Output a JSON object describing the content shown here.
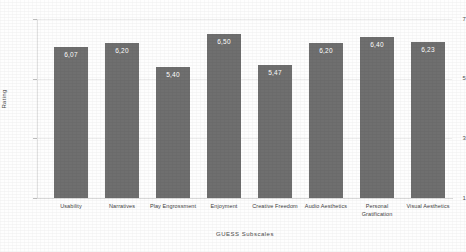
{
  "chart_data": {
    "type": "bar",
    "title": "",
    "xlabel": "GUESS Subscales",
    "ylabel": "Rating",
    "ylim": [
      1,
      7
    ],
    "yticks": [
      "7",
      "5",
      "3",
      "1"
    ],
    "grid": true,
    "legend": "none",
    "bar_color": "#6f6f6f",
    "decimal_separator": ",",
    "categories": [
      "Usability",
      "Narratives",
      "Play Engrossment",
      "Enjoyment",
      "Creative Freedom",
      "Audio Aesthetics",
      "Personal Gratification",
      "Visual Aesthetics"
    ],
    "values": [
      6.07,
      6.2,
      5.4,
      6.5,
      5.47,
      6.2,
      6.4,
      6.23
    ],
    "value_labels": [
      "6,07",
      "6,20",
      "5,40",
      "6,50",
      "5,47",
      "6,20",
      "6,40",
      "6,23"
    ],
    "bars": [
      {
        "category": "Usability",
        "value": 6.07,
        "label": "6,07"
      },
      {
        "category": "Narratives",
        "value": 6.2,
        "label": "6,20"
      },
      {
        "category": "Play Engrossment",
        "value": 5.4,
        "label": "5,40"
      },
      {
        "category": "Enjoyment",
        "value": 6.5,
        "label": "6,50"
      },
      {
        "category": "Creative Freedom",
        "value": 5.47,
        "label": "5,47"
      },
      {
        "category": "Audio Aesthetics",
        "value": 6.2,
        "label": "6,20"
      },
      {
        "category": "Personal Gratification",
        "value": 6.4,
        "label": "6,40"
      },
      {
        "category": "Visual Aesthetics",
        "value": 6.23,
        "label": "6,23"
      }
    ]
  }
}
